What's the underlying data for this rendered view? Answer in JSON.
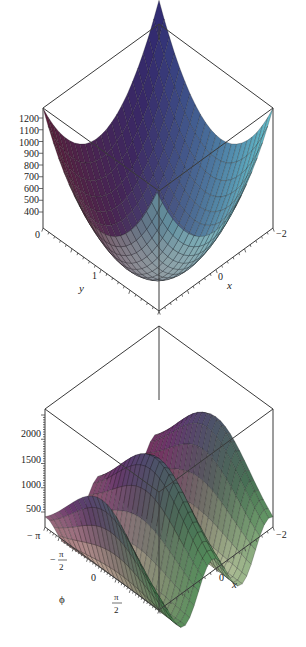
{
  "figure": {
    "width": 306,
    "height": 647
  },
  "chart_data": [
    {
      "type": "surface3d",
      "title": "",
      "description": "Paraboloid-like bowl surface over x in [-2, 2], y in [0, 2]",
      "zlabel": "",
      "xlabel": "x",
      "ylabel": "y",
      "z_ticks": [
        400,
        500,
        600,
        700,
        800,
        900,
        1000,
        1100,
        1200
      ],
      "z_tick_labels": [
        "400",
        "500",
        "600",
        "700",
        "800",
        "900",
        "1000",
        "1100",
        "1200"
      ],
      "x_tick_labels": [
        {
          "value": -2,
          "label": "-2"
        },
        {
          "value": 0,
          "label": "0"
        }
      ],
      "y_tick_labels": [
        {
          "value": 0,
          "label": "0"
        },
        {
          "value": 1,
          "label": "1"
        }
      ],
      "xlim": [
        -2,
        2
      ],
      "ylim": [
        0,
        2
      ],
      "zlim": [
        300,
        1300
      ],
      "colormap": [
        "#5a1f3a",
        "#2b2d7a",
        "#6ad0d6",
        "#e8e6cf"
      ],
      "mesh": true
    },
    {
      "type": "surface3d",
      "title": "",
      "description": "Wavy surface with two peaks over x in [-2, 2], phi in [-pi, pi]",
      "xlabel": "x",
      "ylabel": "ϕ",
      "z_ticks": [
        500,
        1000,
        1500,
        2000
      ],
      "z_tick_labels": [
        "500",
        "1000",
        "1500",
        "2000"
      ],
      "x_tick_labels": [
        {
          "value": -2,
          "label": "-2"
        },
        {
          "value": 0,
          "label": "0"
        }
      ],
      "phi_tick_labels": [
        {
          "value": "-pi",
          "label": "− π"
        },
        {
          "value": "-pi/2",
          "label": "− π/2"
        },
        {
          "value": "0",
          "label": "0"
        },
        {
          "value": "pi/2",
          "label": "π/2"
        }
      ],
      "xlim": [
        -2,
        2
      ],
      "ylim": [
        -3.1416,
        3.1416
      ],
      "zlim": [
        0,
        2400
      ],
      "colormap": [
        "#8a3a4a",
        "#4a2d8a",
        "#e6e2c0",
        "#3a8a4a"
      ],
      "mesh": true
    }
  ],
  "labels": {
    "plot1": {
      "z_ticks": [
        "1200",
        "1100",
        "1000",
        "900",
        "800",
        "700",
        "600",
        "500",
        "400"
      ],
      "y0": "0",
      "y1": "1",
      "y_axis": "y",
      "x0": "0",
      "x_axis": "x",
      "xm2": "−2"
    },
    "plot2": {
      "z_ticks": [
        "2000",
        "1500",
        "1000",
        "500"
      ],
      "phi_mpi": "− π",
      "phi_mpi2_minus": "−",
      "phi_pi": "π",
      "phi_2": "2",
      "phi_0": "0",
      "phi_axis": "ϕ",
      "x0": "0",
      "x_axis": "x",
      "xm2": "−2"
    }
  }
}
